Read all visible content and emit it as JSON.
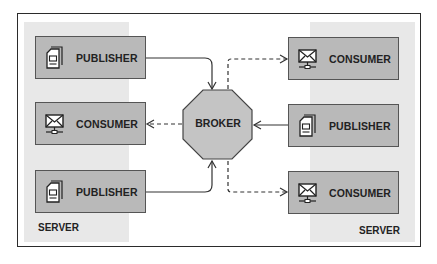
{
  "diagram": {
    "type": "publish-subscribe architecture",
    "broker": {
      "label": "BROKER",
      "shape": "octagon"
    },
    "left_server": {
      "label": "SERVER",
      "nodes": [
        {
          "label": "PUBLISHER",
          "icon": "document-stack-icon"
        },
        {
          "label": "CONSUMER",
          "icon": "envelope-network-icon"
        },
        {
          "label": "PUBLISHER",
          "icon": "document-stack-icon"
        }
      ]
    },
    "right_server": {
      "label": "SERVER",
      "nodes": [
        {
          "label": "CONSUMER",
          "icon": "envelope-network-icon"
        },
        {
          "label": "PUBLISHER",
          "icon": "document-stack-icon"
        },
        {
          "label": "CONSUMER",
          "icon": "envelope-network-icon"
        }
      ]
    },
    "edges": [
      {
        "from": "left_server.nodes.0",
        "to": "broker",
        "style": "solid"
      },
      {
        "from": "left_server.nodes.2",
        "to": "broker",
        "style": "solid"
      },
      {
        "from": "right_server.nodes.1",
        "to": "broker",
        "style": "solid"
      },
      {
        "from": "broker",
        "to": "left_server.nodes.1",
        "style": "dashed"
      },
      {
        "from": "broker",
        "to": "right_server.nodes.0",
        "style": "dashed"
      },
      {
        "from": "broker",
        "to": "right_server.nodes.2",
        "style": "dashed"
      }
    ],
    "colors": {
      "node_fill": "#b9b9b9",
      "panel_fill": "#e8e8e8",
      "broker_fill": "#c4c4c4",
      "stroke": "#333333"
    }
  }
}
